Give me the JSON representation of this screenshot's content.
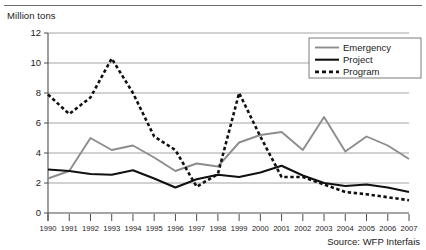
{
  "axis_title": "Million tons",
  "source_note": "Source: WFP Interfais",
  "legend": {
    "items": [
      {
        "label": "Emergency",
        "style": "solid",
        "color": "#8d8d8d",
        "width": 1.9
      },
      {
        "label": "Project",
        "style": "solid",
        "color": "#111111",
        "width": 2.1
      },
      {
        "label": "Program",
        "style": "dashed",
        "color": "#111111",
        "width": 2.6
      }
    ]
  },
  "chart_data": {
    "type": "line",
    "title": "",
    "subtitle": "",
    "xlabel": "",
    "ylabel": "Million tons",
    "ylim": [
      0,
      12
    ],
    "yticks": [
      0,
      2,
      4,
      6,
      8,
      10,
      12
    ],
    "grid": true,
    "legend_position": "top-right",
    "annotations": [
      "Source: WFP Interfais"
    ],
    "categories": [
      "1990",
      "1991",
      "1992",
      "1993",
      "1994",
      "1995",
      "1996",
      "1997",
      "1998",
      "1999",
      "2000",
      "2001",
      "2002",
      "2003",
      "2004",
      "2005",
      "2006",
      "2007"
    ],
    "series": [
      {
        "name": "Emergency",
        "color": "#8d8d8d",
        "style": "solid",
        "values": [
          2.3,
          2.8,
          5.0,
          4.2,
          4.5,
          3.7,
          2.8,
          3.3,
          3.1,
          4.7,
          5.2,
          5.4,
          4.2,
          6.4,
          4.1,
          5.1,
          4.5,
          3.6
        ]
      },
      {
        "name": "Project",
        "color": "#111111",
        "style": "solid",
        "values": [
          2.9,
          2.8,
          2.6,
          2.55,
          2.85,
          2.3,
          1.7,
          2.25,
          2.55,
          2.4,
          2.7,
          3.15,
          2.5,
          2.0,
          1.8,
          1.9,
          1.7,
          1.4
        ]
      },
      {
        "name": "Program",
        "color": "#111111",
        "style": "dashed",
        "values": [
          7.9,
          6.6,
          7.7,
          10.3,
          8.0,
          5.1,
          4.2,
          1.75,
          2.6,
          8.0,
          5.1,
          2.4,
          2.4,
          1.9,
          1.4,
          1.25,
          1.05,
          0.85
        ]
      }
    ]
  }
}
